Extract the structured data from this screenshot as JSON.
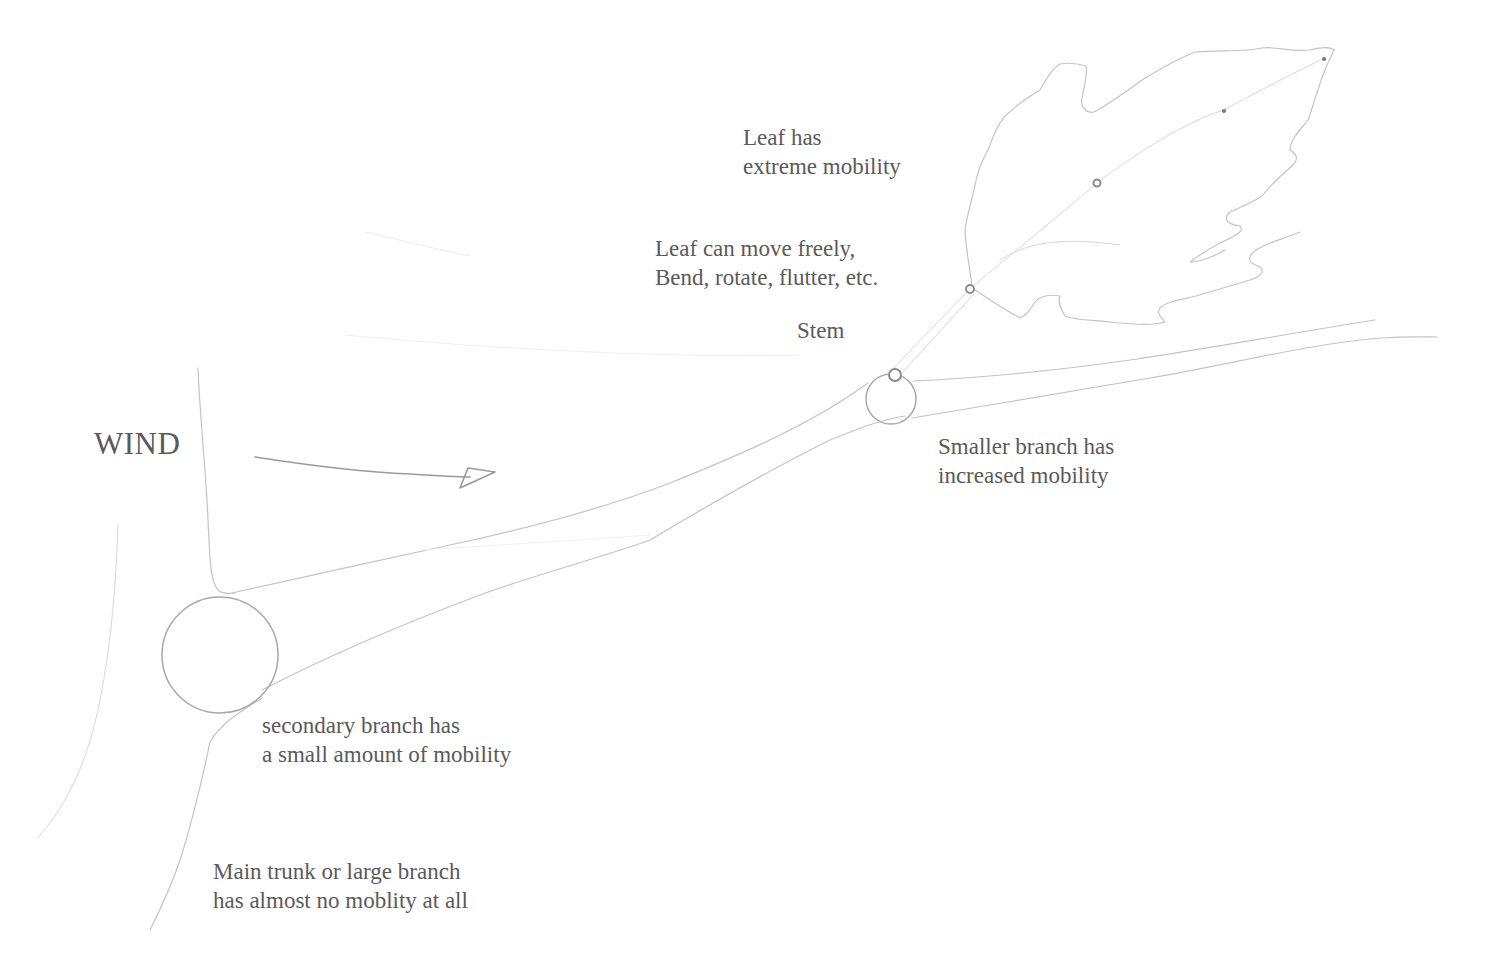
{
  "diagram": {
    "wind_label": "WIND",
    "labels": {
      "leaf": {
        "line1": "Leaf has",
        "line2": "extreme mobility"
      },
      "leaf_motion": {
        "line1": "Leaf can move freely,",
        "line2": "Bend, rotate, flutter, etc."
      },
      "stem": {
        "line1": "Stem"
      },
      "smaller_branch": {
        "line1": "Smaller branch has",
        "line2": "increased mobility"
      },
      "secondary_branch": {
        "line1": "secondary branch has",
        "line2": "a small amount of mobility"
      },
      "main_trunk": {
        "line1": "Main trunk or large branch",
        "line2": "has almost no moblity at all"
      }
    },
    "joints": [
      {
        "name": "trunk-joint",
        "cx": 220,
        "cy": 655,
        "r": 58
      },
      {
        "name": "smaller-branch-joint",
        "cx": 891,
        "cy": 399,
        "r": 25
      },
      {
        "name": "stem-joint",
        "cx": 895,
        "cy": 375,
        "r": 6
      },
      {
        "name": "leaf-base-joint",
        "cx": 970,
        "cy": 289,
        "r": 4
      },
      {
        "name": "leaf-mid-joint",
        "cx": 1097,
        "cy": 183,
        "r": 3.5
      }
    ],
    "colors": {
      "background": "#ffffff",
      "pencil": "#c4c4c4",
      "text": "#5a5a5a"
    }
  }
}
